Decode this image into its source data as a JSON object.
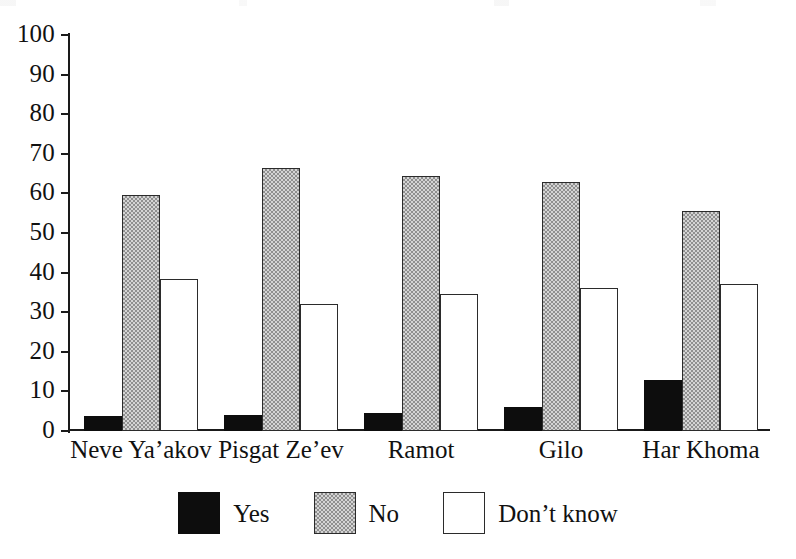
{
  "chart_data": {
    "type": "bar",
    "title": "",
    "xlabel": "",
    "ylabel": "",
    "ylim": [
      0,
      100
    ],
    "grid": false,
    "legend_position": "bottom-center",
    "categories": [
      "Neve Ya’akov",
      "Pisgat Ze’ev",
      "Ramot",
      "Gilo",
      "Har Khoma"
    ],
    "y_ticks": [
      0,
      10,
      20,
      30,
      40,
      50,
      60,
      70,
      80,
      90,
      100
    ],
    "series": [
      {
        "name": "Yes",
        "style": "black",
        "values": [
          3.8,
          4.0,
          4.5,
          6.0,
          13.0
        ]
      },
      {
        "name": "No",
        "style": "gray",
        "values": [
          59.5,
          66.5,
          64.5,
          63.0,
          55.5
        ]
      },
      {
        "name": "Don’t know",
        "style": "white",
        "values": [
          38.5,
          32.0,
          34.5,
          36.0,
          37.0
        ]
      }
    ]
  },
  "legend": {
    "items": [
      {
        "label": "Yes"
      },
      {
        "label": "No"
      },
      {
        "label": "Don’t know"
      }
    ]
  },
  "colors": {
    "yes_fill": "#0d0d0d",
    "no_fill": "#d4d4d4",
    "no_stipple": "#8f8f8f",
    "dontknow_fill": "#ffffff",
    "axis": "#1a1a1a",
    "text": "#111111",
    "background": "#ffffff"
  }
}
